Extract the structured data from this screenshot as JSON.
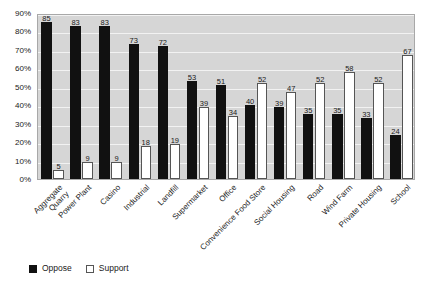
{
  "chart_data": {
    "type": "bar",
    "title": "",
    "subtitle": "",
    "xlabel": "",
    "ylabel": "",
    "ylim": [
      0,
      90
    ],
    "ytick_labels": [
      "0%",
      "10%",
      "20%",
      "30%",
      "40%",
      "50%",
      "60%",
      "70%",
      "80%",
      "90%"
    ],
    "ytick_values": [
      0,
      10,
      20,
      30,
      40,
      50,
      60,
      70,
      80,
      90
    ],
    "grid": true,
    "legend_position": "bottom-left",
    "categories": [
      "Aggregate\nQuarry",
      "Power Plant",
      "Casino",
      "Industrial",
      "Landfill",
      "Supermarket",
      "Office",
      "Convenience Food Store",
      "Social Housing",
      "Road",
      "Wind Farm",
      "Private Housing",
      "School"
    ],
    "series": [
      {
        "name": "Oppose",
        "color": "#111111",
        "values": [
          85,
          83,
          83,
          73,
          72,
          53,
          51,
          40,
          39,
          35,
          35,
          33,
          24
        ]
      },
      {
        "name": "Support",
        "color": "#ffffff",
        "values": [
          5,
          9,
          9,
          18,
          19,
          39,
          34,
          52,
          47,
          52,
          58,
          52,
          67
        ]
      }
    ]
  },
  "legend": {
    "items": [
      {
        "label": "Oppose",
        "style": "filled"
      },
      {
        "label": "Support",
        "style": "outlined"
      }
    ]
  }
}
